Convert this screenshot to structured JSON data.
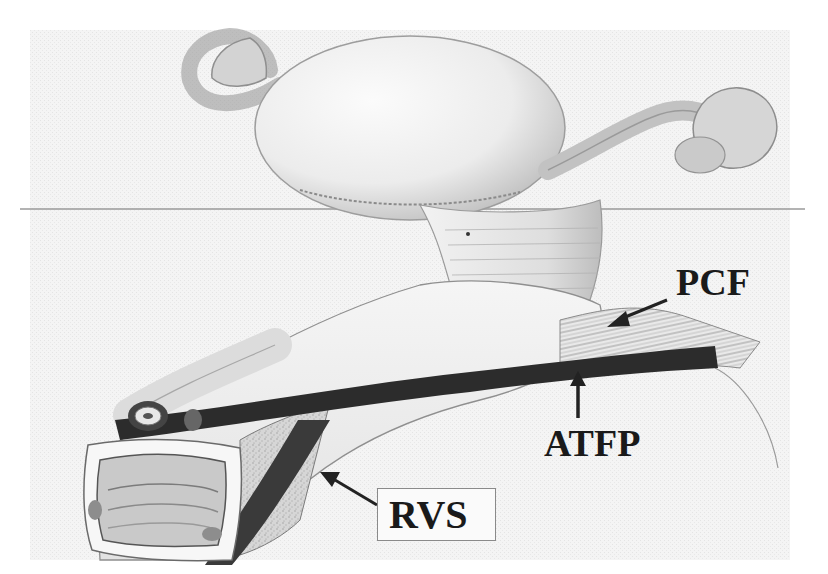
{
  "figure": {
    "type": "anatomical illustration",
    "style": "grayscale pencil drawing",
    "structures": [
      "uterus",
      "fallopian tubes",
      "ovaries",
      "cervix",
      "vagina",
      "urethra"
    ],
    "colors": {
      "background": "#ffffff",
      "texture": "#efefef",
      "tissue_light": "#e6e6e6",
      "tissue_mid": "#b5b5b5",
      "band_dark": "#2a2a2a",
      "label": "#1a1a1a",
      "rule_line": "#9a9a9a"
    }
  },
  "labels": {
    "pcf": {
      "text": "PCF",
      "arrow_direction": "down-left"
    },
    "atfp": {
      "text": "ATFP",
      "arrow_direction": "up"
    },
    "rvs": {
      "text": "RVS",
      "arrow_direction": "up-left",
      "boxed": true
    }
  }
}
